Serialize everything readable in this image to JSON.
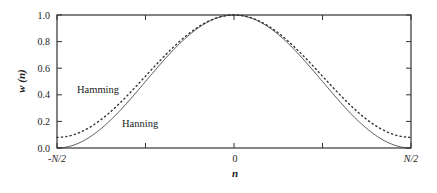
{
  "chart_data": {
    "type": "line",
    "title": "",
    "xlabel": "n",
    "ylabel": "w (n)",
    "xlim": [
      -0.5,
      0.5
    ],
    "ylim": [
      0.0,
      1.0
    ],
    "grid": false,
    "legend": "inline labels",
    "x_ticks": [
      {
        "value": -0.5,
        "label": "-N/2"
      },
      {
        "value": -0.25,
        "label": ""
      },
      {
        "value": 0.0,
        "label": "0"
      },
      {
        "value": 0.25,
        "label": ""
      },
      {
        "value": 0.5,
        "label": "N/2"
      }
    ],
    "y_ticks": [
      {
        "value": 0.0,
        "label": "0.0"
      },
      {
        "value": 0.2,
        "label": "0.2"
      },
      {
        "value": 0.4,
        "label": "0.4"
      },
      {
        "value": 0.6,
        "label": "0.6"
      },
      {
        "value": 0.8,
        "label": "0.8"
      },
      {
        "value": 1.0,
        "label": "1.0"
      }
    ],
    "x": [
      -0.5,
      -0.4,
      -0.3,
      -0.2,
      -0.1,
      0.0,
      0.1,
      0.2,
      0.3,
      0.4,
      0.5
    ],
    "series": [
      {
        "name": "Hamming",
        "style": "dotted",
        "values": [
          0.08,
          0.17,
          0.4,
          0.68,
          0.91,
          1.0,
          0.91,
          0.68,
          0.4,
          0.17,
          0.08
        ]
      },
      {
        "name": "Hanning",
        "style": "solid",
        "values": [
          0.0,
          0.1,
          0.35,
          0.65,
          0.9,
          1.0,
          0.9,
          0.65,
          0.35,
          0.1,
          0.0
        ]
      }
    ],
    "annotations": [
      {
        "text": "Hamming",
        "x": -0.42,
        "y": 0.45
      },
      {
        "text": "Hanning",
        "x": -0.31,
        "y": 0.18
      }
    ]
  },
  "labels": {
    "ylabel": "w (n)",
    "xlabel": "n",
    "hamming": "Hamming",
    "hanning": "Hanning",
    "xticks": [
      "-N/2",
      "0",
      "N/2"
    ],
    "yticks": [
      "0.0",
      "0.2",
      "0.4",
      "0.6",
      "0.8",
      "1.0"
    ]
  }
}
